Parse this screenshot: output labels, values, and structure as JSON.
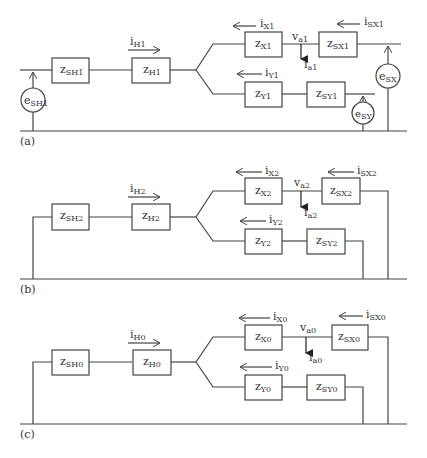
{
  "figure": {
    "panels": [
      {
        "label": "(a)",
        "impedances": {
          "source_h": {
            "base": "z",
            "sub": "SH1"
          },
          "h": {
            "base": "z",
            "sub": "H1"
          },
          "x": {
            "base": "z",
            "sub": "X1"
          },
          "source_x": {
            "base": "z",
            "sub": "SX1"
          },
          "y": {
            "base": "z",
            "sub": "Y1"
          },
          "source_y": {
            "base": "z",
            "sub": "SY1"
          }
        },
        "currents": {
          "h": {
            "base": "i",
            "sub": "H1"
          },
          "x": {
            "base": "i",
            "sub": "X1"
          },
          "source_x": {
            "base": "i",
            "sub": "SX1"
          },
          "y": {
            "base": "i",
            "sub": "Y1"
          },
          "a": {
            "base": "i",
            "sub": "a1"
          }
        },
        "voltage": {
          "base": "v",
          "sub": "a1"
        },
        "sources": {
          "h": {
            "base": "e",
            "sub": "SH1"
          },
          "x": {
            "base": "e",
            "sub": "SX"
          },
          "y": {
            "base": "e",
            "sub": "SY"
          }
        }
      },
      {
        "label": "(b)",
        "impedances": {
          "source_h": {
            "base": "z",
            "sub": "SH2"
          },
          "h": {
            "base": "z",
            "sub": "H2"
          },
          "x": {
            "base": "z",
            "sub": "X2"
          },
          "source_x": {
            "base": "z",
            "sub": "SX2"
          },
          "y": {
            "base": "z",
            "sub": "Y2"
          },
          "source_y": {
            "base": "z",
            "sub": "SY2"
          }
        },
        "currents": {
          "h": {
            "base": "i",
            "sub": "H2"
          },
          "x": {
            "base": "i",
            "sub": "X2"
          },
          "source_x": {
            "base": "i",
            "sub": "SX2"
          },
          "y": {
            "base": "i",
            "sub": "Y2"
          },
          "a": {
            "base": "i",
            "sub": "a2"
          }
        },
        "voltage": {
          "base": "v",
          "sub": "a2"
        }
      },
      {
        "label": "(c)",
        "impedances": {
          "source_h": {
            "base": "z",
            "sub": "SH0"
          },
          "h": {
            "base": "z",
            "sub": "H0"
          },
          "x": {
            "base": "z",
            "sub": "X0"
          },
          "source_x": {
            "base": "z",
            "sub": "SX0"
          },
          "y": {
            "base": "z",
            "sub": "Y0"
          },
          "source_y": {
            "base": "z",
            "sub": "SY0"
          }
        },
        "currents": {
          "h": {
            "base": "i",
            "sub": "H0"
          },
          "x": {
            "base": "i",
            "sub": "X0"
          },
          "source_x": {
            "base": "i",
            "sub": "SX0"
          },
          "y": {
            "base": "i",
            "sub": "Y0"
          },
          "a": {
            "base": "i",
            "sub": "a0"
          }
        },
        "voltage": {
          "base": "v",
          "sub": "a0"
        }
      }
    ]
  }
}
